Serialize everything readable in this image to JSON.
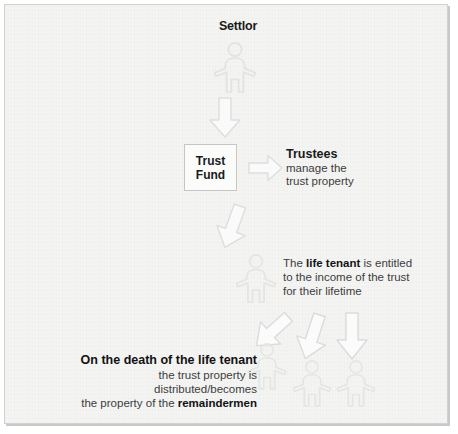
{
  "diagram": {
    "background_color": "#f4f4f3",
    "frame_border_color": "#d2d2d2",
    "figure_outline_color": "#e3e3e2",
    "arrow_outline_color": "#e0e0df",
    "text_color": "#3d3d3d",
    "heading_color": "#1a1a1a"
  },
  "settlor": {
    "label": "Settlor",
    "figure_name": "person-figure-settlor"
  },
  "trust_fund": {
    "line1": "Trust",
    "line2": "Fund"
  },
  "trustees": {
    "heading": "Trustees",
    "line1": "manage the",
    "line2": "trust property"
  },
  "life_tenant": {
    "line1_prefix": "The ",
    "line1_bold": "life tenant",
    "line1_suffix": " is entitled",
    "line2": "to the income of the trust",
    "line3": "for their lifetime",
    "figure_name": "person-figure-life-tenant"
  },
  "remaindermen": {
    "heading": "On the death of the life tenant",
    "line2": "the trust property is distributed/becomes",
    "line3_prefix": "the property of the ",
    "line3_bold": "remaindermen",
    "figure_count": 3
  },
  "arrows": [
    {
      "name": "arrow-settlor-to-trust-fund",
      "direction": "down"
    },
    {
      "name": "arrow-trust-fund-to-trustees",
      "direction": "right"
    },
    {
      "name": "arrow-trust-fund-to-life-tenant",
      "direction": "down-tilted"
    },
    {
      "name": "arrow-life-tenant-to-remainderman-1",
      "direction": "down-left-diagonal"
    },
    {
      "name": "arrow-life-tenant-to-remainderman-2",
      "direction": "down-tilted"
    },
    {
      "name": "arrow-life-tenant-to-remainderman-3",
      "direction": "down"
    }
  ]
}
